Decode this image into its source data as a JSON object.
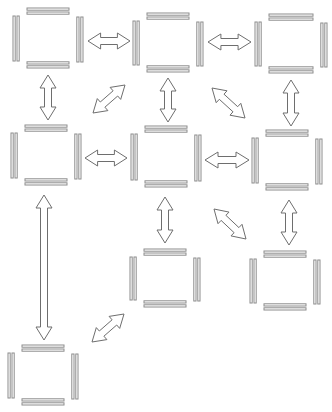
{
  "diagram": {
    "colors": {
      "background": "#ffffff",
      "edge_stroke": "#8c8c8c",
      "arrow_stroke": "#6e6e6e"
    },
    "nodes": [
      {
        "id": "n1",
        "row": 1,
        "col": 1,
        "x": 13,
        "y": 8,
        "w": 70,
        "h": 60
      },
      {
        "id": "n2",
        "row": 1,
        "col": 2,
        "x": 133,
        "y": 13,
        "w": 70,
        "h": 59
      },
      {
        "id": "n3",
        "row": 1,
        "col": 3,
        "x": 255,
        "y": 14,
        "w": 72,
        "h": 59
      },
      {
        "id": "n4",
        "row": 2,
        "col": 1,
        "x": 11,
        "y": 125,
        "w": 70,
        "h": 60
      },
      {
        "id": "n5",
        "row": 2,
        "col": 2,
        "x": 131,
        "y": 126,
        "w": 70,
        "h": 61
      },
      {
        "id": "n6",
        "row": 2,
        "col": 3,
        "x": 252,
        "y": 130,
        "w": 70,
        "h": 60
      },
      {
        "id": "n7",
        "row": 3,
        "col": 2,
        "x": 130,
        "y": 249,
        "w": 70,
        "h": 58
      },
      {
        "id": "n8",
        "row": 3,
        "col": 3,
        "x": 250,
        "y": 251,
        "w": 70,
        "h": 59
      },
      {
        "id": "n9",
        "row": 4,
        "col": 1,
        "x": 8,
        "y": 345,
        "w": 70,
        "h": 60
      }
    ],
    "arrows": [
      {
        "id": "a1",
        "from": "n1",
        "to": "n2",
        "type": "double-headed",
        "x1": 88,
        "y1": 41,
        "x2": 130,
        "y2": 41
      },
      {
        "id": "a2",
        "from": "n2",
        "to": "n3",
        "type": "double-headed",
        "x1": 208,
        "y1": 42,
        "x2": 251,
        "y2": 42
      },
      {
        "id": "a3",
        "from": "n1",
        "to": "n4",
        "type": "double-headed",
        "x1": 48,
        "y1": 75,
        "x2": 48,
        "y2": 120
      },
      {
        "id": "a4",
        "from": "n4",
        "to": "n2",
        "type": "double-headed",
        "x1": 93,
        "y1": 113,
        "x2": 125,
        "y2": 85
      },
      {
        "id": "a5",
        "from": "n2",
        "to": "n5",
        "type": "double-headed",
        "x1": 168,
        "y1": 78,
        "x2": 168,
        "y2": 122
      },
      {
        "id": "a6",
        "from": "n2",
        "to": "n6",
        "type": "double-headed",
        "x1": 212,
        "y1": 88,
        "x2": 245,
        "y2": 118
      },
      {
        "id": "a7",
        "from": "n3",
        "to": "n6",
        "type": "double-headed",
        "x1": 291,
        "y1": 80,
        "x2": 291,
        "y2": 126
      },
      {
        "id": "a8",
        "from": "n4",
        "to": "n5",
        "type": "double-headed",
        "x1": 85,
        "y1": 158,
        "x2": 127,
        "y2": 158
      },
      {
        "id": "a9",
        "from": "n5",
        "to": "n6",
        "type": "double-headed",
        "x1": 205,
        "y1": 160,
        "x2": 249,
        "y2": 160
      },
      {
        "id": "a10",
        "from": "n4",
        "to": "n9",
        "type": "double-headed",
        "x1": 44,
        "y1": 195,
        "x2": 44,
        "y2": 340
      },
      {
        "id": "a11",
        "from": "n5",
        "to": "n7",
        "type": "double-headed",
        "x1": 165,
        "y1": 197,
        "x2": 165,
        "y2": 243
      },
      {
        "id": "a12",
        "from": "n5",
        "to": "n8",
        "type": "double-headed",
        "x1": 214,
        "y1": 209,
        "x2": 246,
        "y2": 239
      },
      {
        "id": "a13",
        "from": "n6",
        "to": "n8",
        "type": "double-headed",
        "x1": 289,
        "y1": 200,
        "x2": 289,
        "y2": 245
      },
      {
        "id": "a14",
        "from": "n9",
        "to": "n7",
        "type": "double-headed",
        "x1": 92,
        "y1": 342,
        "x2": 124,
        "y2": 314
      }
    ]
  }
}
